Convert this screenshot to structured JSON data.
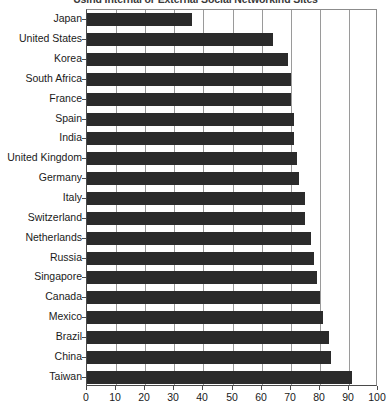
{
  "chart_data": {
    "type": "bar",
    "orientation": "horizontal",
    "title": "Using Internal or External Social Networking Sites",
    "xlabel": "",
    "ylabel": "",
    "xlim": [
      0,
      100
    ],
    "xticks": [
      0,
      10,
      20,
      30,
      40,
      50,
      60,
      70,
      80,
      90,
      100
    ],
    "xticklabels": [
      "0",
      "10",
      "20",
      "30",
      "40",
      "50",
      "60",
      "70",
      "80",
      "90",
      "100"
    ],
    "grid": "vertical",
    "legend": "none",
    "bar_color": "#2b2b2b",
    "categories": [
      "Japan",
      "United States",
      "Korea",
      "South Africa",
      "France",
      "Spain",
      "India",
      "United Kingdom",
      "Germany",
      "Italy",
      "Switzerland",
      "Netherlands",
      "Russia",
      "Singapore",
      "Canada",
      "Mexico",
      "Brazil",
      "China",
      "Taiwan"
    ],
    "values": [
      36,
      64,
      69,
      70,
      70,
      71,
      71,
      72,
      73,
      75,
      75,
      77,
      78,
      79,
      80,
      81,
      83,
      84,
      91
    ]
  }
}
